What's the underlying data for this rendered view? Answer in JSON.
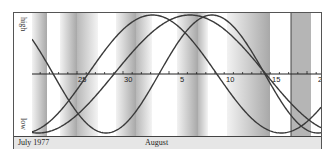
{
  "chart_data": {
    "type": "line",
    "title": "",
    "xlabel": "",
    "ylabel": "",
    "y_axis_labels": {
      "top": "high",
      "bottom": "low"
    },
    "month_labels": [
      {
        "label": "July 1977",
        "x_px": 4
      },
      {
        "label": "August",
        "x_px": 131
      }
    ],
    "x_axis": {
      "start_day": "July 20, 1977",
      "px_per_day": 9.2,
      "plot_origin_px": 0,
      "tick_labels": [
        {
          "label": "25",
          "x_px": 45
        },
        {
          "label": "30",
          "x_px": 91
        },
        {
          "label": "5",
          "x_px": 147
        },
        {
          "label": "10",
          "x_px": 193
        },
        {
          "label": "15",
          "x_px": 239
        },
        {
          "label": "20",
          "x_px": 285
        }
      ],
      "minor_tick_every_px": 9.2,
      "axis_y_px": 61
    },
    "y_range": [
      -1,
      1
    ],
    "marker_line_x_px": 259,
    "series": [
      {
        "name": "23-day cycle",
        "period_days": 23,
        "zero_cross_up_px": 127,
        "color": "#3a3a3a"
      },
      {
        "name": "28-day cycle",
        "period_days": 28,
        "zero_cross_up_px": 56,
        "color": "#3a3a3a"
      },
      {
        "name": "33-day cycle",
        "period_days": 33,
        "zero_cross_up_px": 82,
        "color": "#3a3a3a"
      }
    ],
    "bands": [
      {
        "x": 0,
        "w": 15,
        "dir": "dark-right"
      },
      {
        "x": 28,
        "w": 17,
        "dir": "dark-right"
      },
      {
        "x": 45,
        "w": 21,
        "dir": "light-left"
      },
      {
        "x": 84,
        "w": 20,
        "dir": "dark-right"
      },
      {
        "x": 104,
        "w": 16,
        "dir": "light-left"
      },
      {
        "x": 145,
        "w": 21,
        "dir": "dark-right"
      },
      {
        "x": 166,
        "w": 10,
        "dir": "light-left"
      },
      {
        "x": 195,
        "w": 43,
        "dir": "dark-right"
      },
      {
        "x": 259,
        "w": 20,
        "dir": "solid"
      }
    ],
    "grid": false,
    "legend": "none"
  }
}
